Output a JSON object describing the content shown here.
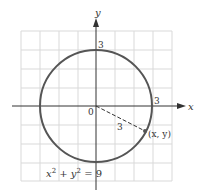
{
  "diagram": {
    "type": "circle-on-grid",
    "equation": {
      "lhs_x": "x",
      "sup1": "2",
      "plus": " + ",
      "lhs_y": "y",
      "sup2": "2",
      "eq": " = 9"
    },
    "axes": {
      "x_label": "x",
      "y_label": "y",
      "origin_label": "0"
    },
    "tick_labels": {
      "y_intercept": "3",
      "x_intercept": "3"
    },
    "radius_label": "3",
    "point_label": "(x, y)",
    "colors": {
      "grid": "#d9d9d9",
      "axis": "#333333",
      "circle": "#555555",
      "text": "#333333",
      "point": "#555555"
    }
  }
}
